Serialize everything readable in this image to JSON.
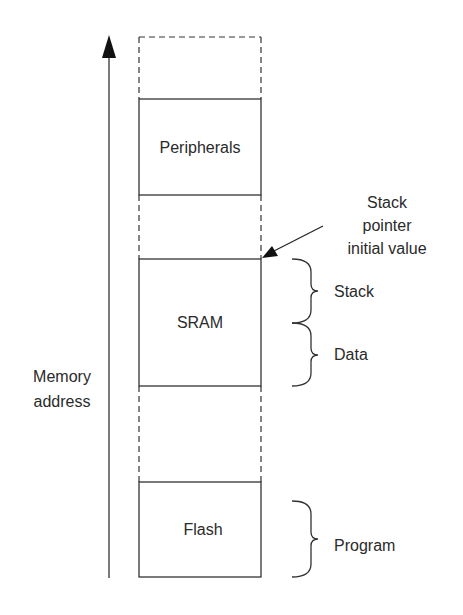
{
  "diagram": {
    "axis_label": [
      "Memory",
      "address"
    ],
    "regions": [
      {
        "name": "unused-top",
        "label": "",
        "style": "dashed"
      },
      {
        "name": "peripherals",
        "label": "Peripherals",
        "style": "solid"
      },
      {
        "name": "unused-mid",
        "label": "",
        "style": "dashed"
      },
      {
        "name": "sram",
        "label": "SRAM",
        "style": "solid"
      },
      {
        "name": "unused-low",
        "label": "",
        "style": "dashed"
      },
      {
        "name": "flash",
        "label": "Flash",
        "style": "solid"
      }
    ],
    "annotation": {
      "lines": [
        "Stack",
        "pointer",
        "initial value"
      ]
    },
    "braces": [
      {
        "label": "Stack"
      },
      {
        "label": "Data"
      },
      {
        "label": "Program"
      }
    ],
    "colors": {
      "line": "#333333",
      "text": "#2a2a2a",
      "background": "#ffffff"
    }
  }
}
